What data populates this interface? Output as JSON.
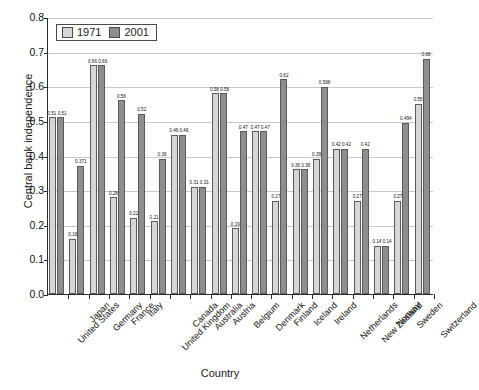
{
  "chart_data": {
    "type": "bar",
    "title": "",
    "xlabel": "Country",
    "ylabel": "Central bank independence",
    "ylim": [
      0,
      0.8
    ],
    "ytick_step": 0.1,
    "yticks": [
      "0.0",
      "0.1",
      "0.2",
      "0.3",
      "0.4",
      "0.5",
      "0.6",
      "0.7",
      "0.8"
    ],
    "grid": true,
    "legend_position": "top-left",
    "categories": [
      "United States",
      "Japan",
      "Germany",
      "France",
      "Italy",
      "United Kingdom",
      "Canada",
      "Australia",
      "Austria",
      "Belgium",
      "Denmark",
      "Finland",
      "Iceland",
      "Ireland",
      "Netherlands",
      "New Zealand",
      "Norway",
      "Sweden",
      "Switzerland"
    ],
    "series": [
      {
        "name": "1971",
        "color": "#d6d6d6",
        "values": [
          0.51,
          0.16,
          0.66,
          0.28,
          0.22,
          0.21,
          0.46,
          0.31,
          0.58,
          0.19,
          0.47,
          0.27,
          0.36,
          0.39,
          0.42,
          0.27,
          0.14,
          0.27,
          0.55
        ],
        "labels": [
          "0.51",
          "0.16",
          "0.66",
          "0.28",
          "0.22",
          "0.21",
          "0.46",
          "0.31",
          "0.58",
          "0.19",
          "0.47",
          "0.27",
          "0.36",
          "0.39",
          "0.42",
          "0.27",
          "0.14",
          "0.27",
          "0.55"
        ]
      },
      {
        "name": "2001",
        "color": "#8e8e8e",
        "values": [
          0.51,
          0.371,
          0.66,
          0.56,
          0.52,
          0.39,
          0.46,
          0.31,
          0.58,
          0.47,
          0.47,
          0.62,
          0.36,
          0.598,
          0.42,
          0.42,
          0.14,
          0.494,
          0.68
        ],
        "labels": [
          "0.51",
          "0.371",
          "0.66",
          "0.56",
          "0.52",
          "0.39",
          "0.46",
          "0.31",
          "0.58",
          "0.47",
          "0.47",
          "0.62",
          "0.36",
          "0.598",
          "0.42",
          "0.42",
          "0.14",
          "0.494",
          "0.68"
        ]
      }
    ],
    "group_labels": [
      "0.51 0.51",
      "",
      "0.66 0.66",
      "",
      "",
      "",
      "0.46 0.46",
      "0.31 0.31",
      "0.58 0.58",
      "",
      "0.47 0.47",
      "",
      "0.36 0.36",
      "",
      "0.42 0.42",
      "",
      "0.14 0.14",
      "",
      ""
    ]
  },
  "legend": {
    "items": [
      {
        "label": "1971"
      },
      {
        "label": "2001"
      }
    ]
  }
}
